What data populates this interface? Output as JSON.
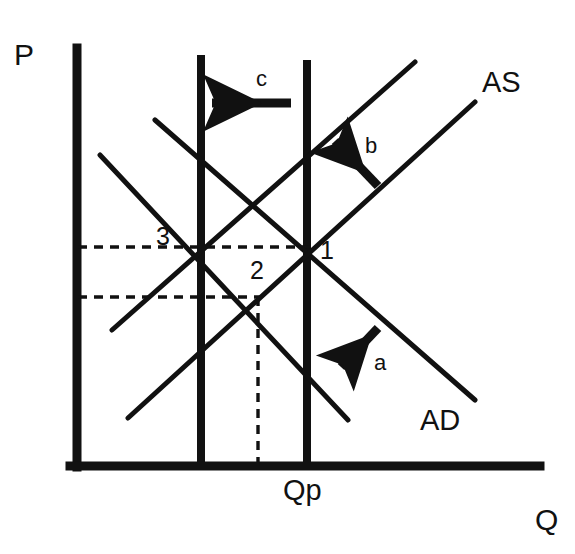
{
  "colors": {
    "ink": "#111111",
    "background": "#ffffff"
  },
  "axes": {
    "y_label": "P",
    "x_label": "Q",
    "y_label_pos": {
      "x": 14,
      "y": 40
    },
    "x_label_pos": {
      "x": 535,
      "y": 505
    },
    "vertical_axis": {
      "x": 77,
      "y_top": 48,
      "y_bottom": 467,
      "width": 9
    },
    "horizontal_axis": {
      "y": 466,
      "x_left": 70,
      "x_right": 540,
      "width": 9
    }
  },
  "vertical_lines": [
    {
      "name": "potential-output-left-line",
      "x": 201,
      "y_top": 55,
      "y_bottom": 466,
      "width": 8
    },
    {
      "name": "potential-output-line",
      "x": 307,
      "y_top": 60,
      "y_bottom": 466,
      "width": 8
    }
  ],
  "tick_labels": [
    {
      "text": "Qp",
      "x": 283,
      "y": 476
    }
  ],
  "curves": [
    {
      "name": "ad-shifted-curve",
      "kind": "AD",
      "x1": 100,
      "y1": 155,
      "x2": 348,
      "y2": 420,
      "width": 5
    },
    {
      "name": "ad-original-curve",
      "kind": "AD",
      "x1": 155,
      "y1": 120,
      "x2": 475,
      "y2": 400,
      "width": 5
    },
    {
      "name": "as-shifted-curve",
      "kind": "AS",
      "x1": 112,
      "y1": 330,
      "x2": 415,
      "y2": 62,
      "width": 5
    },
    {
      "name": "as-original-curve",
      "kind": "AS",
      "x1": 128,
      "y1": 418,
      "x2": 475,
      "y2": 102,
      "width": 5
    }
  ],
  "curve_labels": [
    {
      "name": "as-label",
      "text": "AS",
      "x": 482,
      "y": 68
    },
    {
      "name": "ad-label",
      "text": "AD",
      "x": 420,
      "y": 406
    }
  ],
  "equilibrium_points": [
    {
      "name": "point-1",
      "label": "1",
      "x": 307,
      "y": 247,
      "label_x": 320,
      "label_y": 238
    },
    {
      "name": "point-2",
      "label": "2",
      "x": 258,
      "y": 297,
      "label_x": 250,
      "label_y": 258
    },
    {
      "name": "point-3",
      "label": "3",
      "x": 201,
      "y": 247,
      "label_x": 156,
      "label_y": 224
    }
  ],
  "dashed_guides": [
    {
      "name": "price-level-1-guide",
      "orientation": "horizontal",
      "x1": 78,
      "y1": 247,
      "x2": 312,
      "y2": 247
    },
    {
      "name": "price-level-2-guide",
      "orientation": "horizontal",
      "x1": 78,
      "y1": 297,
      "x2": 262,
      "y2": 297
    },
    {
      "name": "output-2-guide",
      "orientation": "vertical",
      "x1": 258,
      "y1": 297,
      "x2": 258,
      "y2": 466
    }
  ],
  "arrows": [
    {
      "name": "arrow-a",
      "label": "a",
      "direction": "down-left",
      "x1": 378,
      "y1": 328,
      "x2": 341,
      "y2": 367,
      "label_x": 374,
      "label_y": 352
    },
    {
      "name": "arrow-b",
      "label": "b",
      "direction": "up-left",
      "x1": 378,
      "y1": 186,
      "x2": 335,
      "y2": 141,
      "label_x": 365,
      "label_y": 135
    },
    {
      "name": "arrow-c",
      "label": "c",
      "direction": "left",
      "x1": 291,
      "y1": 103,
      "x2": 212,
      "y2": 103,
      "label_x": 256,
      "label_y": 68
    }
  ]
}
